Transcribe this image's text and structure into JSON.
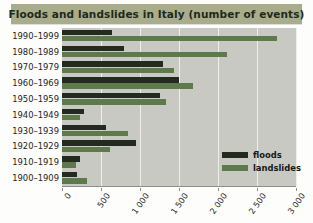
{
  "title": "Floods and landslides in Italy (number of events)",
  "legend": {
    "position": "inside-right",
    "items": [
      {
        "name": "floods-swatch",
        "label": "floods",
        "color": "#232b20"
      },
      {
        "name": "landslides-swatch",
        "label": "landslides",
        "color": "#5e7a4c"
      }
    ]
  },
  "axis": {
    "tick_labels": [
      "0",
      "500",
      "1 000",
      "1 500",
      "2 000",
      "2 500",
      "3 000"
    ],
    "tick_values": [
      0,
      500,
      1000,
      1500,
      2000,
      2500,
      3000
    ]
  },
  "colors": {
    "title_bar": "#a9ad8b",
    "title_text": "#1d2a1b",
    "plot_background": "#c9c9c4",
    "gridline": "#efefe9",
    "floods": "#232b20",
    "landslides": "#5e7a4c",
    "page_background": "#fdfdfb"
  },
  "chart_data": {
    "type": "bar",
    "orientation": "horizontal",
    "title": "Floods and landslides in Italy (number of events)",
    "xlabel": "",
    "ylabel": "",
    "xlim": [
      0,
      3000
    ],
    "grid": true,
    "legend_position": "inside-right",
    "categories": [
      "1990–1999",
      "1980–1989",
      "1970–1979",
      "1960–1969",
      "1950–1959",
      "1940–1949",
      "1930–1939",
      "1920–1929",
      "1910–1919",
      "1900–1909"
    ],
    "series": [
      {
        "name": "floods",
        "color": "#232b20",
        "values": [
          640,
          790,
          1290,
          1500,
          1250,
          280,
          560,
          950,
          230,
          190
        ]
      },
      {
        "name": "landslides",
        "color": "#5e7a4c",
        "values": [
          2750,
          2120,
          1430,
          1680,
          1330,
          230,
          840,
          620,
          180,
          320
        ]
      }
    ]
  }
}
